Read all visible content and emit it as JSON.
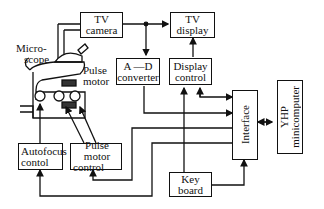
{
  "diagram": {
    "blocks": {
      "tv_camera": {
        "line1": "TV",
        "line2": "camera"
      },
      "tv_display": {
        "line1": "TV",
        "line2": "display"
      },
      "ad_converter": {
        "line1": "A —D",
        "line2": "converter"
      },
      "display_control": {
        "line1": "Display",
        "line2": "control"
      },
      "interface": {
        "label": "Interface"
      },
      "minicomputer": {
        "line1": "YHP",
        "line2": "minicomputer"
      },
      "autofocus_control": {
        "line1": "Autofocus",
        "line2": "contol"
      },
      "pulse_motor_control": {
        "line1": "Pulse motor",
        "line2": "control"
      },
      "keyboard": {
        "line1": "Key",
        "line2": "board"
      }
    },
    "labels": {
      "microscope_1": "Micro-",
      "microscope_2": "scope",
      "pulse_motor_1": "Pulse",
      "pulse_motor_2": "motor"
    },
    "colors": {
      "line": "#111111",
      "background": "#ffffff"
    }
  }
}
